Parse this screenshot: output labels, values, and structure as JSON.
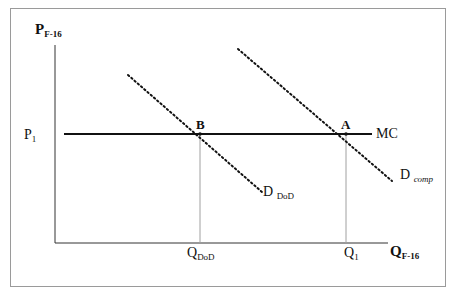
{
  "diagram": {
    "type": "supply-demand",
    "y_axis": {
      "label": "P",
      "subscript": "F-16"
    },
    "x_axis": {
      "label": "Q",
      "subscript": "F-16"
    },
    "price_level": {
      "label": "P",
      "subscript": "1"
    },
    "curves": [
      {
        "id": "mc",
        "label": "MC",
        "style": "solid"
      },
      {
        "id": "d_dod",
        "label": "D",
        "subscript": "DoD",
        "style": "dotted"
      },
      {
        "id": "d_comp",
        "label": "D",
        "subscript": "comp",
        "style": "dotted"
      }
    ],
    "points": [
      {
        "id": "b",
        "label": "B"
      },
      {
        "id": "a",
        "label": "A"
      }
    ],
    "quantities": [
      {
        "id": "q_dod",
        "label": "Q",
        "subscript": "DoD"
      },
      {
        "id": "q1",
        "label": "Q",
        "subscript": "1"
      }
    ],
    "colors": {
      "line": "#111111",
      "guide": "#a0a0a0",
      "frame": "#9a9a9a"
    }
  }
}
